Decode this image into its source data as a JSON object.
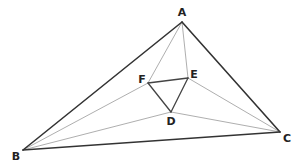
{
  "diagram": {
    "type": "geometry",
    "points": {
      "A": {
        "label": "A",
        "x": 182,
        "y": 22,
        "lx": 182,
        "ly": 16
      },
      "B": {
        "label": "B",
        "x": 23,
        "y": 150,
        "lx": 16,
        "ly": 160
      },
      "C": {
        "label": "C",
        "x": 280,
        "y": 132,
        "lx": 287,
        "ly": 142
      },
      "D": {
        "label": "D",
        "x": 171,
        "y": 112,
        "lx": 171,
        "ly": 125
      },
      "E": {
        "label": "E",
        "x": 188,
        "y": 78,
        "lx": 194,
        "ly": 78
      },
      "F": {
        "label": "F",
        "x": 148,
        "y": 83,
        "lx": 142,
        "ly": 83
      }
    },
    "outer_triangle": [
      "A",
      "B",
      "C"
    ],
    "inner_triangle": [
      "D",
      "E",
      "F"
    ],
    "trisector_segments": [
      [
        "A",
        "F"
      ],
      [
        "A",
        "E"
      ],
      [
        "B",
        "F"
      ],
      [
        "B",
        "D"
      ],
      [
        "C",
        "D"
      ],
      [
        "C",
        "E"
      ]
    ],
    "colors": {
      "stroke_dark": "#333333",
      "stroke_thin": "#777777",
      "label": "#222222"
    }
  }
}
